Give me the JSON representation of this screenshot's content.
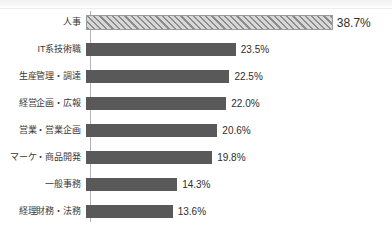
{
  "chart_data": {
    "type": "bar",
    "orientation": "horizontal",
    "title": "",
    "subtitle": "",
    "xlabel": "",
    "ylabel": "",
    "unit": "%",
    "grid": false,
    "legend": null,
    "axis_line": "vertical",
    "xlim": [
      0,
      40
    ],
    "categories": [
      "人事",
      "IT系技術職",
      "生産管理・調達",
      "経営企画・広報",
      "営業・営業企画",
      "マーケ・商品開発",
      "一般事務",
      "経理財務・法務"
    ],
    "values": [
      38.7,
      23.5,
      22.5,
      22.0,
      20.6,
      19.8,
      14.3,
      13.6
    ],
    "value_labels": [
      "38.7%",
      "23.5%",
      "22.5%",
      "22.0%",
      "20.6%",
      "19.8%",
      "14.3%",
      "13.6%"
    ],
    "bar_styles": [
      "hatched",
      "solid",
      "solid",
      "solid",
      "solid",
      "solid",
      "solid",
      "solid"
    ],
    "highlight_index": 0,
    "colors": {
      "bar_solid": "#595959",
      "bar_hatch_fill": "#c9c9c9",
      "bar_hatch_stripe": "#8d8d8d",
      "axis_line": "#b4b4b4",
      "category_label": "#3a3a3a",
      "value_label": "#2e2e2e",
      "background": "#ffffff"
    }
  }
}
